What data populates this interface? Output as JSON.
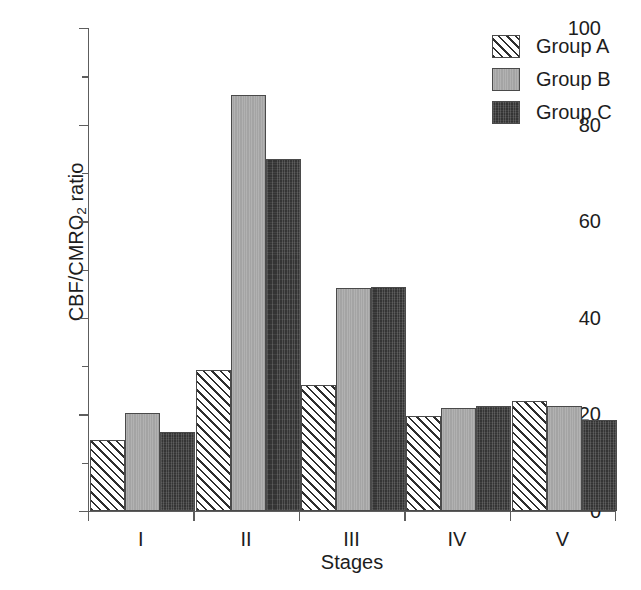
{
  "chart_data": {
    "type": "bar",
    "title": "",
    "xlabel": "Stages",
    "ylabel": "CBF/CMRO2 ratio",
    "ylabel_parts": {
      "before": "CBF/CMRO",
      "sub": "2",
      "after": " ratio"
    },
    "categories": [
      "I",
      "II",
      "III",
      "IV",
      "V"
    ],
    "series": [
      {
        "name": "Group A",
        "pattern": "diagonal-hatch",
        "color": "#ffffff",
        "values": [
          14.7,
          29.2,
          26.1,
          19.6,
          22.8
        ]
      },
      {
        "name": "Group B",
        "pattern": "solid-gray",
        "color": "#a9a9a9",
        "values": [
          20.2,
          86.1,
          46.2,
          21.3,
          21.8
        ]
      },
      {
        "name": "Group C",
        "pattern": "dark-crosshatch",
        "color": "#343434",
        "values": [
          16.4,
          72.8,
          46.3,
          21.8,
          18.9
        ]
      }
    ],
    "ylim": [
      0,
      100
    ],
    "yticks": [
      0,
      20,
      40,
      60,
      80,
      100
    ],
    "ytick_labels": [
      "0",
      "20",
      "40",
      "60",
      "80",
      "100"
    ],
    "yticks_minor": [
      10,
      30,
      50,
      70,
      90
    ],
    "grid": false,
    "legend_position": "top-right"
  },
  "legend": {
    "entries": [
      {
        "label": "Group A"
      },
      {
        "label": "Group B"
      },
      {
        "label": "Group C"
      }
    ]
  }
}
